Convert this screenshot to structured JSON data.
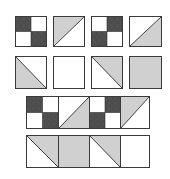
{
  "colors": {
    "dark": "#4a4a4a",
    "light": "#cfcfcf",
    "white": "#ffffff",
    "line": "#2e2e2e"
  },
  "grid": {
    "row1": [
      {
        "type": "four-patch",
        "dark": [
          "top-left",
          "bottom-right"
        ]
      },
      {
        "type": "half-triangle",
        "diagonal": "bottom-left-to-top-right",
        "shaded": "upper-left"
      },
      {
        "type": "four-patch",
        "dark": [
          "top-right",
          "bottom-left"
        ]
      },
      {
        "type": "half-triangle",
        "diagonal": "bottom-left-to-top-right",
        "shaded": "lower-right"
      }
    ],
    "row2": [
      {
        "type": "half-triangle",
        "diagonal": "top-left-to-bottom-right",
        "shaded": "lower-left"
      },
      {
        "type": "plain",
        "fill": "white"
      },
      {
        "type": "half-triangle",
        "diagonal": "top-left-to-bottom-right",
        "shaded": "upper-right"
      },
      {
        "type": "plain",
        "fill": "light"
      }
    ]
  },
  "strips": {
    "strip1": [
      {
        "type": "four-patch",
        "dark": [
          "top-left",
          "bottom-right"
        ]
      },
      {
        "type": "half-triangle",
        "diagonal": "bottom-left-to-top-right",
        "shaded": "lower-right"
      },
      {
        "type": "four-patch",
        "dark": [
          "top-right",
          "bottom-left"
        ]
      },
      {
        "type": "half-triangle",
        "diagonal": "bottom-left-to-top-right",
        "shaded": "upper-left"
      }
    ],
    "strip2": [
      {
        "type": "half-triangle",
        "diagonal": "top-left-to-bottom-right",
        "shaded": "upper-right"
      },
      {
        "type": "plain",
        "fill": "light"
      },
      {
        "type": "half-triangle",
        "diagonal": "top-left-to-bottom-right",
        "shaded": "upper-right"
      },
      {
        "type": "plain",
        "fill": "white"
      }
    ]
  }
}
